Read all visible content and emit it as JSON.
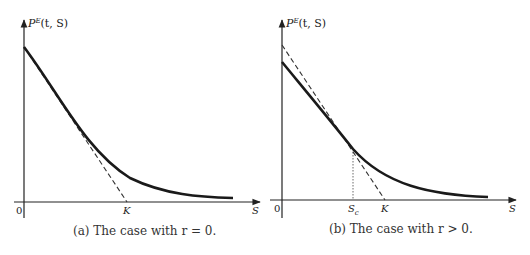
{
  "panels": [
    {
      "id": "a",
      "y_axis_label": "P",
      "y_axis_label_sup": "E",
      "y_axis_label_args": "(t, S)",
      "x_axis_label": "S",
      "origin_label": "0",
      "strike_label": "K",
      "caption": "(a) The case with r = 0."
    },
    {
      "id": "b",
      "y_axis_label": "P",
      "y_axis_label_sup": "E",
      "y_axis_label_args": "(t, S)",
      "x_axis_label": "S",
      "origin_label": "0",
      "critical_label": "S",
      "critical_label_sub": "c",
      "strike_label": "K",
      "caption": "(b) The case with r > 0."
    }
  ],
  "colors": {
    "axis": "#222222",
    "curve": "#1a1a1a",
    "dashed": "#333333"
  }
}
